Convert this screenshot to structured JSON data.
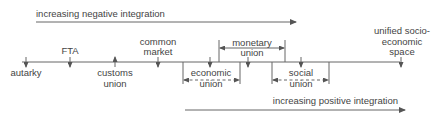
{
  "diagram": {
    "top_arrow": {
      "label": "increasing negative integration"
    },
    "bottom_arrow": {
      "label": "increasing positive integration"
    },
    "stages": [
      {
        "id": "autarky",
        "lines": [
          "autarky"
        ]
      },
      {
        "id": "fta",
        "lines": [
          "FTA"
        ]
      },
      {
        "id": "customs-union",
        "lines": [
          "customs",
          "union"
        ]
      },
      {
        "id": "common-market",
        "lines": [
          "common",
          "market"
        ]
      },
      {
        "id": "economic-union",
        "lines": [
          "economic",
          "union"
        ]
      },
      {
        "id": "monetary-union",
        "lines": [
          "monetary",
          "union"
        ]
      },
      {
        "id": "social-union",
        "lines": [
          "social",
          "union"
        ]
      },
      {
        "id": "unified-space",
        "lines": [
          "unified socio-",
          "economic",
          "space"
        ]
      }
    ],
    "colors": {
      "line": "#666666",
      "text": "#444444"
    }
  }
}
